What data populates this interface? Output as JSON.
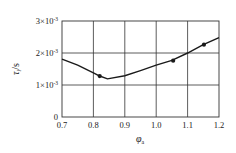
{
  "chart_data": {
    "type": "line",
    "title": "",
    "xlabel": "φ",
    "xlabel_sub": "a",
    "ylabel": "τ",
    "ylabel_sub": "i",
    "ylabel_unit": "/s",
    "xlim": [
      0.7,
      1.2
    ],
    "ylim": [
      0,
      0.003
    ],
    "grid": true,
    "x_ticks": [
      0.7,
      0.8,
      0.9,
      1.0,
      1.1,
      1.2
    ],
    "x_tick_labels": [
      "0.7",
      "0.8",
      "0.9",
      "1.0",
      "1.1",
      "1.2"
    ],
    "y_ticks": [
      0,
      0.001,
      0.002,
      0.003
    ],
    "y_tick_labels": [
      {
        "mant": "0",
        "exp": ""
      },
      {
        "mant": "1×10",
        "exp": "-3"
      },
      {
        "mant": "2×10",
        "exp": "-3"
      },
      {
        "mant": "3×10",
        "exp": "-3"
      }
    ],
    "series": [
      {
        "name": "fitted curve",
        "x": [
          0.7,
          0.75,
          0.8,
          0.82,
          0.845,
          0.9,
          0.95,
          1.0,
          1.05,
          1.1,
          1.15,
          1.2
        ],
        "y": [
          0.00181,
          0.00162,
          0.00138,
          0.00128,
          0.00119,
          0.00129,
          0.00145,
          0.00162,
          0.00177,
          0.002,
          0.00226,
          0.00248
        ]
      },
      {
        "name": "measured points",
        "x": [
          0.82,
          1.054,
          1.152
        ],
        "y": [
          0.00128,
          0.00176,
          0.00226
        ]
      }
    ]
  }
}
